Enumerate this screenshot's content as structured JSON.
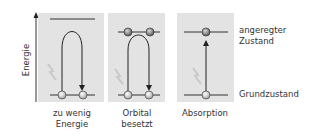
{
  "axis": {
    "label": "Energie"
  },
  "panels": [
    {
      "caption_line1": "zu wenig",
      "caption_line2": "Energie",
      "case": "insufficient-energy"
    },
    {
      "caption_line1": "Orbital",
      "caption_line2": "besetzt",
      "case": "orbital-occupied"
    },
    {
      "caption_line1": "Absorption",
      "caption_line2": "",
      "case": "absorption"
    }
  ],
  "states": {
    "excited_line1": "angeregter",
    "excited_line2": "Zustand",
    "ground": "Grundzustand"
  },
  "colors": {
    "panel_bg": "#e2e2e2",
    "line": "#333333",
    "electron_light": "#d0d0d0",
    "electron_dark": "#7a7a7a",
    "photon": "#c8c8c8"
  }
}
